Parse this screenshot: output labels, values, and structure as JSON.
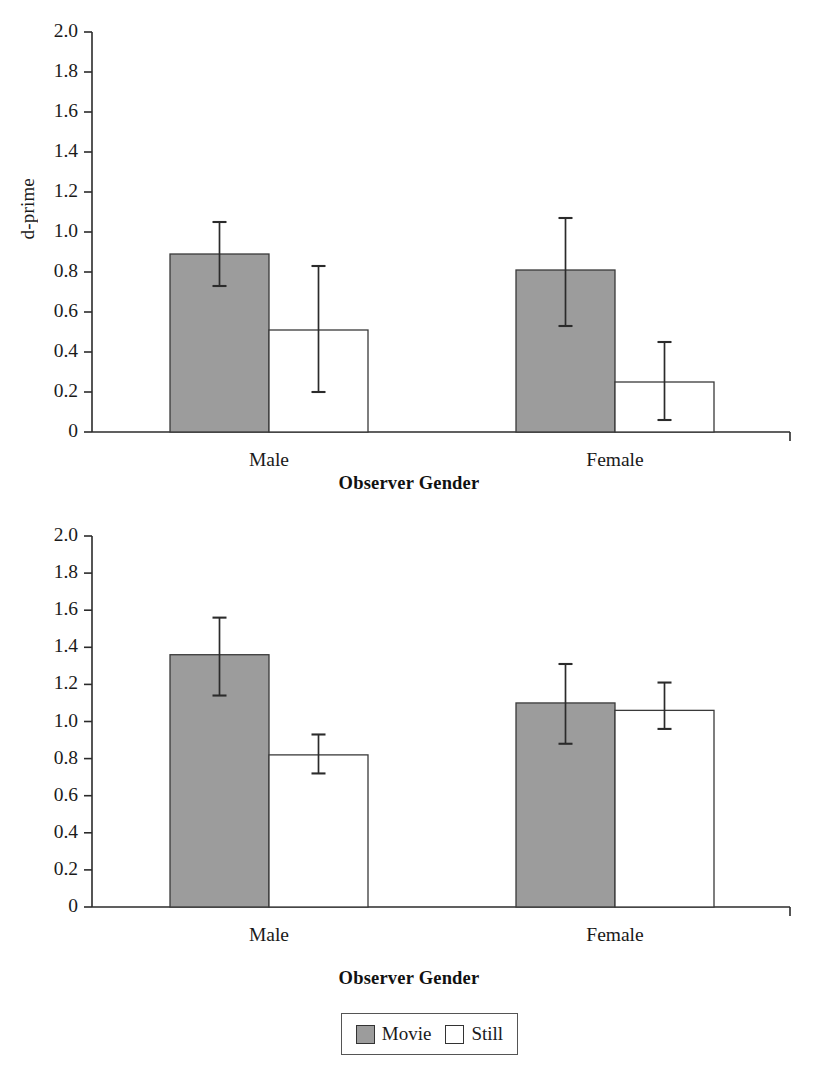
{
  "figure": {
    "background": "#ffffff",
    "ink_color": "#1a1a1a",
    "movie_fill": "#9c9c9c",
    "still_fill": "#ffffff"
  },
  "legend": {
    "position": "bottom-center",
    "entries": [
      {
        "label": "Movie",
        "swatch": "filled-gray-square",
        "color": "#9c9c9c"
      },
      {
        "label": "Still",
        "swatch": "open-white-square",
        "color": "#ffffff"
      }
    ]
  },
  "chart_data": [
    {
      "id": "dprime",
      "type": "bar",
      "title": "",
      "xlabel": "Observer Gender",
      "ylabel": "d-prime",
      "categories": [
        "Male",
        "Female"
      ],
      "ylim": [
        0,
        2.0
      ],
      "yticks": [
        0,
        0.2,
        0.4,
        0.6,
        0.8,
        1.0,
        1.2,
        1.4,
        1.6,
        1.8,
        2.0
      ],
      "ytick_labels": [
        "0",
        "0.2",
        "0.4",
        "0.6",
        "0.8",
        "1.0",
        "1.2",
        "1.4",
        "1.6",
        "1.8",
        "2.0"
      ],
      "grid": false,
      "errorbars": true,
      "series": [
        {
          "name": "Movie",
          "color": "#9c9c9c",
          "values": [
            0.89,
            0.81
          ],
          "err_low": [
            0.73,
            0.53
          ],
          "err_high": [
            1.05,
            1.07
          ]
        },
        {
          "name": "Still",
          "color": "#ffffff",
          "values": [
            0.51,
            0.25
          ],
          "err_low": [
            0.2,
            0.06
          ],
          "err_high": [
            0.83,
            0.45
          ]
        }
      ]
    },
    {
      "id": "beta",
      "type": "bar",
      "title": "",
      "xlabel": "Observer Gender",
      "ylabel": "β (response bias)",
      "categories": [
        "Male",
        "Female"
      ],
      "ylim": [
        0,
        2.0
      ],
      "yticks": [
        0,
        0.2,
        0.4,
        0.6,
        0.8,
        1.0,
        1.2,
        1.4,
        1.6,
        1.8,
        2.0
      ],
      "ytick_labels": [
        "0",
        "0.2",
        "0.4",
        "0.6",
        "0.8",
        "1.0",
        "1.2",
        "1.4",
        "1.6",
        "1.8",
        "2.0"
      ],
      "grid": false,
      "errorbars": true,
      "series": [
        {
          "name": "Movie",
          "color": "#9c9c9c",
          "values": [
            1.36,
            1.1
          ],
          "err_low": [
            1.14,
            0.88
          ],
          "err_high": [
            1.56,
            1.31
          ]
        },
        {
          "name": "Still",
          "color": "#ffffff",
          "values": [
            0.82,
            1.06
          ],
          "err_low": [
            0.72,
            0.96
          ],
          "err_high": [
            0.93,
            1.21
          ]
        }
      ]
    }
  ]
}
